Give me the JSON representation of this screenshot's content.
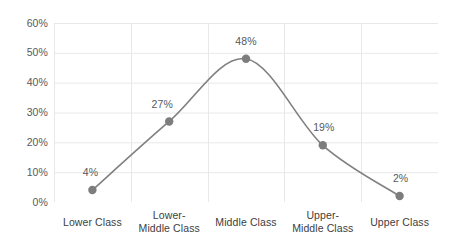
{
  "chart_data": {
    "type": "line",
    "title": "",
    "subtitle": "",
    "xlabel": "",
    "ylabel": "",
    "categories": [
      "Lower Class",
      "Lower-Middle Class",
      "Middle Class",
      "Upper-Middle Class",
      "Upper Class"
    ],
    "category_lines": [
      [
        "Lower Class"
      ],
      [
        "Lower-",
        "Middle Class"
      ],
      [
        "Middle Class"
      ],
      [
        "Upper-",
        "Middle Class"
      ],
      [
        "Upper Class"
      ]
    ],
    "values": [
      4,
      27,
      48,
      19,
      2
    ],
    "data_labels": [
      "4%",
      "27%",
      "48%",
      "19%",
      "2%"
    ],
    "ylim": [
      0,
      60
    ],
    "ytick_values": [
      0,
      10,
      20,
      30,
      40,
      50,
      60
    ],
    "ytick_labels": [
      "0%",
      "10%",
      "20%",
      "30%",
      "40%",
      "50%",
      "60%"
    ],
    "grid": {
      "horizontal": true,
      "vertical": true
    },
    "legend": {
      "show": false,
      "position": "none",
      "entries": []
    },
    "smooth": true,
    "colors": {
      "line": "#808080",
      "marker": "#7d7d7d",
      "gridline": "#e8e8e8",
      "axis_text": "#58595b",
      "category_text": "#404041",
      "background": "#ffffff"
    }
  }
}
